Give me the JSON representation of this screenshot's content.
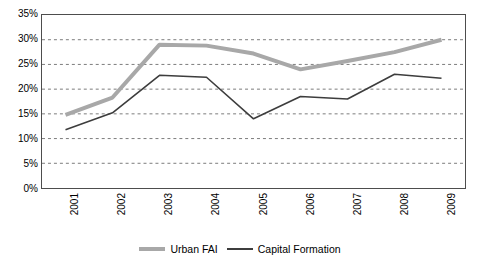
{
  "chart_data": {
    "type": "line",
    "title": "",
    "subtitle": "",
    "xlabel": "",
    "ylabel": "",
    "categories": [
      "2001",
      "2002",
      "2003",
      "2004",
      "2005",
      "2006",
      "2007",
      "2008",
      "2009"
    ],
    "ylim": [
      0,
      35
    ],
    "ytick_values": [
      35,
      30,
      25,
      20,
      15,
      10,
      5,
      0
    ],
    "ytick_labels": [
      "35%",
      "30%",
      "25%",
      "20%",
      "15%",
      "10%",
      "5%",
      "0%"
    ],
    "grid": true,
    "grid_style": "dashed-horizontal",
    "legend_position": "bottom-center",
    "series": [
      {
        "name": "Urban FAI",
        "color": "#a8a8a8",
        "line_width": 4,
        "values": [
          14.8,
          18.3,
          29.0,
          28.8,
          27.2,
          24.0,
          25.7,
          27.5,
          30.0
        ]
      },
      {
        "name": "Capital Formation",
        "color": "#3d3d3d",
        "line_width": 1.6,
        "values": [
          11.8,
          15.2,
          22.8,
          22.4,
          14.0,
          18.5,
          18.0,
          23.0,
          22.2
        ]
      }
    ]
  },
  "legend": {
    "items": [
      {
        "label": "Urban FAI"
      },
      {
        "label": "Capital Formation"
      }
    ]
  },
  "colors": {
    "urban_fai": "#a8a8a8",
    "capital_formation": "#3d3d3d",
    "axis": "#4d4d4d",
    "grid": "#7a7a7a",
    "background": "#ffffff"
  }
}
